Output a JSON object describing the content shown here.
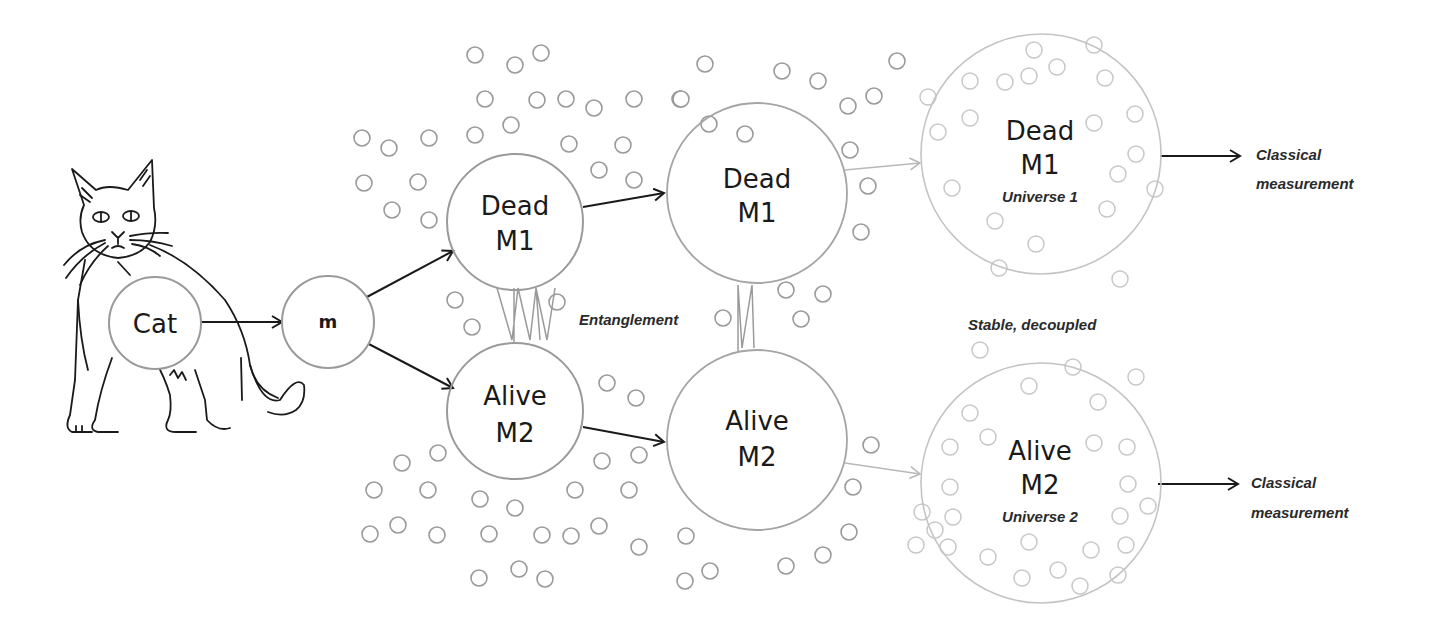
{
  "diagram": {
    "nodes": {
      "cat": {
        "label": "Cat"
      },
      "m": {
        "label": "m"
      },
      "dead1": {
        "line1": "Dead",
        "line2": "M1"
      },
      "alive1": {
        "line1": "Alive",
        "line2": "M2"
      },
      "dead2": {
        "line1": "Dead",
        "line2": "M1"
      },
      "alive2": {
        "line1": "Alive",
        "line2": "M2"
      },
      "dead3": {
        "line1": "Dead",
        "line2": "M1",
        "line3": "Universe 1"
      },
      "alive3": {
        "line1": "Alive",
        "line2": "M2",
        "line3": "Universe 2"
      }
    },
    "annotations": {
      "entanglement": "Entanglement",
      "stable": "Stable, decoupled",
      "classical1_line1": "Classical",
      "classical1_line2": "measurement",
      "classical2_line1": "Classical",
      "classical2_line2": "measurement"
    },
    "colors": {
      "stroke_dark": "#1a1a1a",
      "stroke_mid": "#8c8c8c",
      "stroke_light": "#c4c4c4"
    }
  }
}
